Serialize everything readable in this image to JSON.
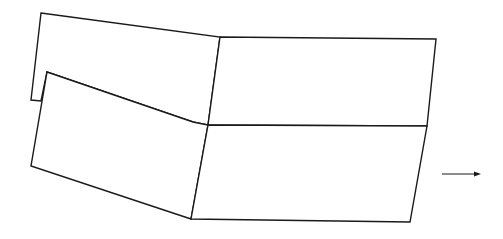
{
  "diagram": {
    "type": "folded-panels-schematic",
    "stroke_color": "#1a1a1a",
    "background": "#ffffff",
    "panels": [
      {
        "id": "back-left-panel",
        "points": "41,13 220,37 208,125 193,122 47,72 41,101 31,100"
      },
      {
        "id": "front-left-panel",
        "points": "47,72 193,122 208,125 191,219 31,166"
      },
      {
        "id": "upper-right-panel",
        "points": "220,37 436,39 427,126 208,125"
      },
      {
        "id": "lower-right-panel",
        "points": "208,125 427,126 410,222 191,219"
      }
    ],
    "arrow": {
      "direction": "right",
      "x1": 442,
      "y1": 174,
      "x2": 481,
      "y2": 174
    }
  }
}
